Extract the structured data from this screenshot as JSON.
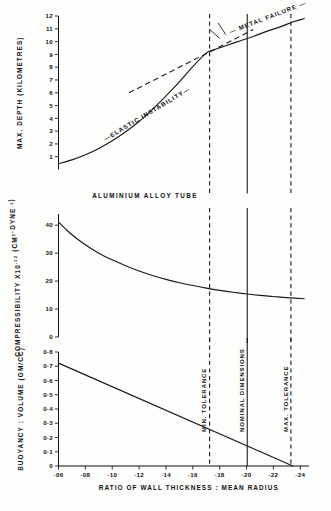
{
  "figure": {
    "background": "#fdfdfc",
    "ink": "#111111",
    "annotation_material": "ALUMINIUM  ALLOY  TUBE"
  },
  "x_axis": {
    "label": "RATIO  OF  WALL  THICKNESS  :  MEAN  RADIUS",
    "ticks": [
      "·06",
      "·08",
      "·10",
      "·12",
      "·14",
      "·16",
      "·18",
      "·20",
      "·22",
      "·24"
    ],
    "tick_values": [
      0.06,
      0.08,
      0.1,
      0.12,
      0.14,
      0.16,
      0.18,
      0.2,
      0.22,
      0.24
    ],
    "range": [
      0.06,
      0.245
    ]
  },
  "reference_lines": [
    {
      "name": "min-tolerance",
      "label": "MIN. TOLERANCE",
      "x": 0.1725,
      "style": "dashed"
    },
    {
      "name": "nominal-dimensions",
      "label": "NOMINAL DIMENSIONS",
      "x": 0.2005,
      "style": "solid"
    },
    {
      "name": "max-tolerance",
      "label": "MAX. TOLERANCE",
      "x": 0.233,
      "style": "dashed"
    }
  ],
  "chart_data": [
    {
      "type": "line",
      "panel": "top",
      "title": "",
      "ylabel": "MAX. DEPTH  (KILOMETRES)",
      "xlabel": "RATIO OF WALL THICKNESS : MEAN RADIUS",
      "ylim": [
        0,
        12
      ],
      "xlim": [
        0.06,
        0.245
      ],
      "yticks": [
        "1",
        "2",
        "3",
        "4",
        "5",
        "6",
        "7",
        "8",
        "9",
        "10",
        "11",
        "12"
      ],
      "ytick_values": [
        1,
        2,
        3,
        4,
        5,
        6,
        7,
        8,
        9,
        10,
        11,
        12
      ],
      "grid": false,
      "legend": "none",
      "annotations": [
        {
          "text": "—ELASTIC  INSTABILITY—",
          "at_x": 0.095,
          "at_y": 2.2,
          "rotation": -31
        },
        {
          "text": "— METAL  FAILURE —",
          "at_x": 0.188,
          "at_y": 10.6,
          "rotation": -21
        }
      ],
      "series": [
        {
          "name": "elastic-instability-curve",
          "style": "solid",
          "x": [
            0.06,
            0.07,
            0.08,
            0.09,
            0.1,
            0.11,
            0.12,
            0.13,
            0.14,
            0.15,
            0.16,
            0.17,
            0.1755,
            0.185,
            0.195,
            0.205,
            0.215,
            0.225,
            0.235,
            0.243
          ],
          "values": [
            0.45,
            0.75,
            1.15,
            1.65,
            2.25,
            2.95,
            3.75,
            4.7,
            5.75,
            6.85,
            8.05,
            9.1,
            9.35,
            9.7,
            10.05,
            10.4,
            10.8,
            11.15,
            11.55,
            11.8
          ]
        },
        {
          "name": "metal-failure-line",
          "style": "dashed",
          "x": [
            0.1125,
            0.1755,
            0.205
          ],
          "values": [
            6.0,
            9.35,
            10.95
          ]
        }
      ]
    },
    {
      "type": "line",
      "panel": "middle",
      "title": "",
      "ylabel": "COMPRESSIBILITY  X10⁻¹² (CM²·DYNE⁻¹)",
      "ylabel_parts": {
        "main": "COMPRESSIBILITY  X10",
        "exp1": "-12",
        "paren": "(CM",
        "exp2": "2",
        "mid": "·DYNE",
        "exp3": "-1",
        "close": ")"
      },
      "ylim": [
        0,
        44
      ],
      "xlim": [
        0.06,
        0.245
      ],
      "yticks": [
        "10",
        "20",
        "30",
        "40"
      ],
      "ytick_values": [
        10,
        20,
        30,
        40
      ],
      "grid": false,
      "legend": "none",
      "series": [
        {
          "name": "compressibility-curve",
          "style": "solid",
          "x": [
            0.06,
            0.065,
            0.07,
            0.08,
            0.09,
            0.1,
            0.11,
            0.12,
            0.13,
            0.14,
            0.15,
            0.16,
            0.17,
            0.18,
            0.19,
            0.2,
            0.21,
            0.22,
            0.23,
            0.243
          ],
          "values": [
            41.2,
            38.8,
            36.6,
            33.0,
            30.0,
            27.6,
            25.5,
            23.6,
            22.0,
            20.6,
            19.4,
            18.4,
            17.5,
            16.7,
            16.0,
            15.4,
            14.9,
            14.5,
            14.1,
            13.7
          ]
        }
      ]
    },
    {
      "type": "line",
      "panel": "bottom",
      "title": "",
      "ylabel": "BUOYANCY : VOLUME  (GM/CC)",
      "ylim": [
        0,
        0.8
      ],
      "xlim": [
        0.06,
        0.245
      ],
      "yticks": [
        "0·1",
        "0·2",
        "0·3",
        "0·4",
        "0·5",
        "0·6",
        "0·7",
        "0·8"
      ],
      "ytick_values": [
        0.1,
        0.2,
        0.3,
        0.4,
        0.5,
        0.6,
        0.7,
        0.8
      ],
      "grid": false,
      "legend": "none",
      "series": [
        {
          "name": "buoyancy-volume-line",
          "style": "solid",
          "x": [
            0.06,
            0.2345
          ],
          "values": [
            0.722,
            0.0
          ]
        }
      ]
    }
  ]
}
